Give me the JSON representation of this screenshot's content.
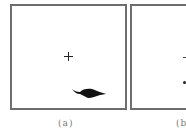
{
  "figure": {
    "panels": [
      {
        "id": "a",
        "caption": "(a)",
        "markers": [
          {
            "type": "crosshair",
            "x": 68,
            "y": 56
          },
          {
            "type": "blob",
            "x": 72,
            "y": 88,
            "w": 34,
            "h": 11,
            "color": "#111111"
          }
        ]
      },
      {
        "id": "b",
        "caption": "(b",
        "markers": [
          {
            "type": "crosshair-partial",
            "x": 184,
            "y": 57
          },
          {
            "type": "dot",
            "x": 185,
            "y": 82
          }
        ]
      }
    ],
    "frame_color": "#6e6e6e",
    "caption_color": "#777777"
  }
}
